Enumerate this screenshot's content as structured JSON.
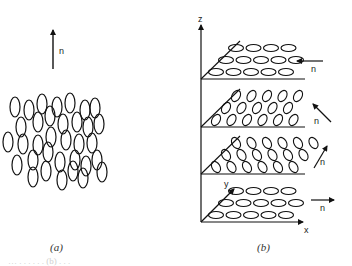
{
  "figure": {
    "panel_a": {
      "caption": "(a)",
      "director_label": "n",
      "director_direction": "up",
      "description": "Nematic phase: elongated molecules with long axes roughly parallel to director n, positions disordered"
    },
    "panel_b": {
      "caption": "(b)",
      "axes": {
        "z": "z",
        "y": "y",
        "x": "x"
      },
      "description": "Chiral (cholesteric) phase: stacked layers, director n rotates from layer to layer",
      "layers": [
        {
          "name": "top",
          "director_label": "n",
          "director_direction": "left",
          "rows": 3,
          "molecules_per_row": [
            4,
            5,
            5
          ],
          "molecule_orientation": "along-x"
        },
        {
          "name": "upper-middle",
          "director_label": "n",
          "director_direction": "up-left",
          "rows": 3,
          "molecules_per_row": [
            5,
            5,
            6
          ],
          "molecule_orientation": "tilted-left"
        },
        {
          "name": "lower-middle",
          "director_label": "n",
          "director_direction": "up-right",
          "rows": 3,
          "molecules_per_row": [
            6,
            6,
            6
          ],
          "molecule_orientation": "tilted-right"
        },
        {
          "name": "bottom",
          "director_label": "n",
          "director_direction": "right",
          "rows": 3,
          "molecules_per_row": [
            4,
            5,
            5
          ],
          "molecule_orientation": "along-x"
        }
      ]
    },
    "footer_fragment": "… . . .   . . .   (b) . . ."
  }
}
